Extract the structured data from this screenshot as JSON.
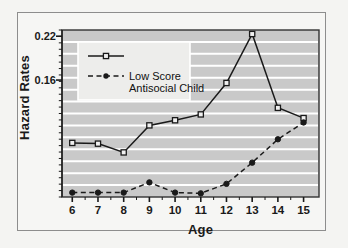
{
  "figure": {
    "frame_color": "#8d8d8d",
    "page_background": "#f4f4f2",
    "plot_background": "#c9c9c9",
    "gridline_color": "#ffffff",
    "ink_color": "#1a1a1a"
  },
  "chart_data": {
    "type": "line",
    "title": "",
    "xlabel": "Age",
    "ylabel": "Hazard Rates",
    "x": [
      6,
      7,
      8,
      9,
      10,
      11,
      12,
      13,
      14,
      15
    ],
    "xtick_labels": [
      "6",
      "7",
      "8",
      "9",
      "10",
      "11",
      "12",
      "13",
      "14",
      "15"
    ],
    "ytick_labels": [
      "0.16",
      "0.22"
    ],
    "ytick_values": [
      0.16,
      0.22
    ],
    "xlim": [
      5.6,
      15.6
    ],
    "ylim": [
      0.0,
      0.2285
    ],
    "grid": "horizontal",
    "gridline_count": 13,
    "legend_position": "upper-left-inside",
    "series": [
      {
        "name": "",
        "legend_label": "",
        "style": "solid",
        "marker": "open-square",
        "values": [
          0.074,
          0.073,
          0.061,
          0.098,
          0.105,
          0.113,
          0.156,
          0.223,
          0.122,
          0.108
        ]
      },
      {
        "name": "Low Score Antisocial Child",
        "legend_label": "Low Score\nAntisocial Child",
        "style": "dashed",
        "marker": "filled-circle",
        "values": [
          0.006,
          0.006,
          0.006,
          0.02,
          0.006,
          0.005,
          0.018,
          0.047,
          0.079,
          0.102
        ]
      }
    ]
  },
  "legend": {
    "entry1_label": "",
    "entry2_label_line1": "Low Score",
    "entry2_label_line2": "Antisocial Child"
  }
}
